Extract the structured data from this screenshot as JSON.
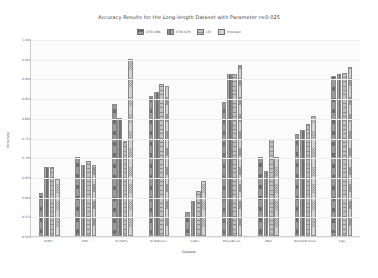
{
  "chart_data": {
    "type": "bar",
    "title": "Accuracy Results for the Long-length Dataset with Parameter r=0.025",
    "xlabel": "Dataset",
    "ylabel": "Accuracy",
    "ylim": [
      0.5,
      1.0
    ],
    "yticks": [
      "0.50",
      "0.55",
      "0.60",
      "0.65",
      "0.70",
      "0.75",
      "0.80",
      "0.85",
      "0.90",
      "0.95",
      "1.00"
    ],
    "grid": true,
    "legend_position": "top-center",
    "categories": [
      "ACSF1",
      "Beef",
      "BeetleFly",
      "BirdChicken",
      "Coffee",
      "EthanolLevel",
      "Meat",
      "MoteStrainCross",
      "Yoga"
    ],
    "series": [
      {
        "name": "DTW-1NN",
        "values": [
          0.61,
          0.7,
          0.835,
          0.855,
          0.56,
          0.84,
          0.7,
          0.76,
          0.905
        ]
      },
      {
        "name": "DTW-SVM",
        "values": [
          0.675,
          0.68,
          0.8,
          0.865,
          0.59,
          0.91,
          0.665,
          0.77,
          0.91
        ]
      },
      {
        "name": "LSF",
        "values": [
          0.675,
          0.69,
          0.74,
          0.885,
          0.615,
          0.91,
          0.745,
          0.785,
          0.915
        ]
      },
      {
        "name": "Proposed",
        "values": [
          0.645,
          0.68,
          0.95,
          0.88,
          0.64,
          0.935,
          0.7,
          0.805,
          0.93
        ]
      }
    ]
  }
}
